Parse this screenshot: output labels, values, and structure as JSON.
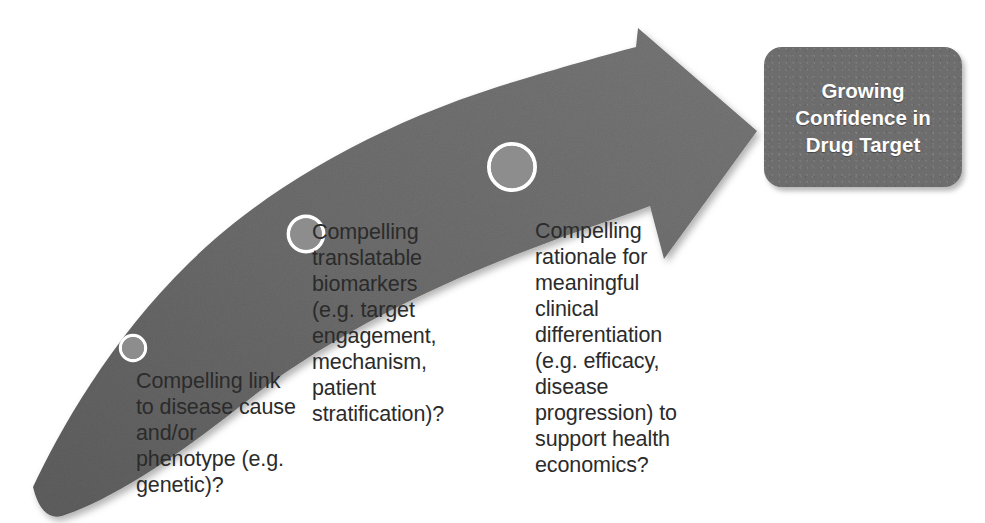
{
  "diagram": {
    "title": "Growing Confidence in Drug Target",
    "arrow": {
      "name": "upward-curving-arrow",
      "direction": "left-to-right ascending",
      "fill_color": "#6b6b6b",
      "milestone_count": 3
    },
    "milestones": [
      {
        "id": "milestone-1",
        "marker_label": "",
        "text": "Compelling link\nto disease cause\nand/or\nphenotype (e.g.\ngenetic)?",
        "marker_size": "small",
        "marker_color": "#8d8d8d",
        "marker_ring_color": "#ffffff"
      },
      {
        "id": "milestone-2",
        "marker_label": "",
        "text": "Compelling\ntranslatable\nbiomarkers\n(e.g. target\nengagement,\nmechanism,\npatient\nstratification)?",
        "marker_size": "medium",
        "marker_color": "#8d8d8d",
        "marker_ring_color": "#ffffff"
      },
      {
        "id": "milestone-3",
        "marker_label": "",
        "text": "Compelling\nrationale for\nmeaningful\nclinical\ndifferentiation\n(e.g. efficacy,\ndisease\nprogression) to\nsupport health\neconomics?",
        "marker_size": "large",
        "marker_color": "#8d8d8d",
        "marker_ring_color": "#ffffff"
      }
    ],
    "outcome_box": {
      "label": "Growing\nConfidence in\nDrug Target",
      "fill_color": "#6d6d6d",
      "text_color": "#ffffff"
    },
    "colors": {
      "background": "#ffffff",
      "arrow": "#6b6b6b",
      "box": "#6d6d6d",
      "caption_text": "#2b2b2b",
      "marker_fill": "#8d8d8d",
      "marker_ring": "#ffffff"
    }
  }
}
